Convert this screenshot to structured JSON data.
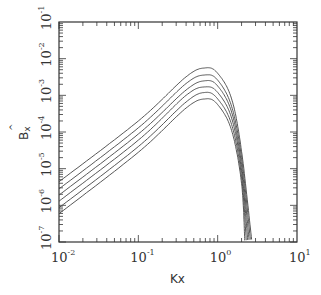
{
  "chart_data": {
    "type": "line",
    "title": "",
    "xlabel": "Kx",
    "ylabel": "B̂x",
    "xscale": "log",
    "yscale": "log",
    "xlim": [
      0.01,
      10
    ],
    "ylim": [
      1e-07,
      0.1
    ],
    "x_ticks": [
      "10^-2",
      "10^-1",
      "10^0",
      "10^1"
    ],
    "y_ticks": [
      "10^-7",
      "10^-6",
      "10^-5",
      "10^-4",
      "10^-3",
      "10^-2",
      "10^-1"
    ],
    "grid": false,
    "legend": null,
    "series": [
      {
        "name": "curve 1",
        "points": [
          [
            0.01,
            4.4e-06
          ],
          [
            0.1,
            0.0002
          ],
          [
            0.4,
            0.0032
          ],
          [
            0.7,
            0.0056
          ],
          [
            1.0,
            0.004
          ],
          [
            1.5,
            0.0008
          ],
          [
            2.0,
            3e-05
          ],
          [
            2.7,
            1e-07
          ]
        ]
      },
      {
        "name": "curve 2",
        "points": [
          [
            0.01,
            2.8e-06
          ],
          [
            0.1,
            0.00013
          ],
          [
            0.4,
            0.0021
          ],
          [
            0.7,
            0.0036
          ],
          [
            1.0,
            0.0026
          ],
          [
            1.5,
            0.0005
          ],
          [
            2.0,
            2e-05
          ],
          [
            2.6,
            1e-07
          ]
        ]
      },
      {
        "name": "curve 3",
        "points": [
          [
            0.01,
            1.9e-06
          ],
          [
            0.1,
            8.8e-05
          ],
          [
            0.4,
            0.0014
          ],
          [
            0.7,
            0.0025
          ],
          [
            1.0,
            0.0018
          ],
          [
            1.5,
            0.00035
          ],
          [
            2.0,
            1.3e-05
          ],
          [
            2.5,
            1e-07
          ]
        ]
      },
      {
        "name": "curve 4",
        "points": [
          [
            0.01,
            1.3e-06
          ],
          [
            0.1,
            6e-05
          ],
          [
            0.4,
            0.001
          ],
          [
            0.7,
            0.0017
          ],
          [
            1.0,
            0.0012
          ],
          [
            1.5,
            0.00024
          ],
          [
            2.0,
            9e-06
          ],
          [
            2.4,
            1e-07
          ]
        ]
      },
      {
        "name": "curve 5",
        "points": [
          [
            0.01,
            8.6e-07
          ],
          [
            0.1,
            4e-05
          ],
          [
            0.4,
            0.00066
          ],
          [
            0.7,
            0.0012
          ],
          [
            1.0,
            0.0008
          ],
          [
            1.5,
            0.00016
          ],
          [
            2.0,
            6e-06
          ],
          [
            2.3,
            1e-07
          ]
        ]
      },
      {
        "name": "curve 6",
        "points": [
          [
            0.01,
            5.9e-07
          ],
          [
            0.1,
            2.8e-05
          ],
          [
            0.4,
            0.00045
          ],
          [
            0.7,
            0.0008
          ],
          [
            1.0,
            0.00056
          ],
          [
            1.5,
            0.00011
          ],
          [
            2.0,
            4e-06
          ],
          [
            2.2,
            1e-07
          ]
        ]
      }
    ]
  },
  "axes": {
    "x_label": "Kx",
    "y_label_main": "B",
    "y_label_sub": "x",
    "x_tick_base": [
      "10",
      "10",
      "10",
      "10"
    ],
    "x_tick_exp": [
      "-2",
      "-1",
      "0",
      "1"
    ],
    "y_tick_base": [
      "10",
      "10",
      "10",
      "10",
      "10",
      "10",
      "10"
    ],
    "y_tick_exp": [
      "-1",
      "-2",
      "-3",
      "-4",
      "-5",
      "-6",
      "-7"
    ]
  }
}
